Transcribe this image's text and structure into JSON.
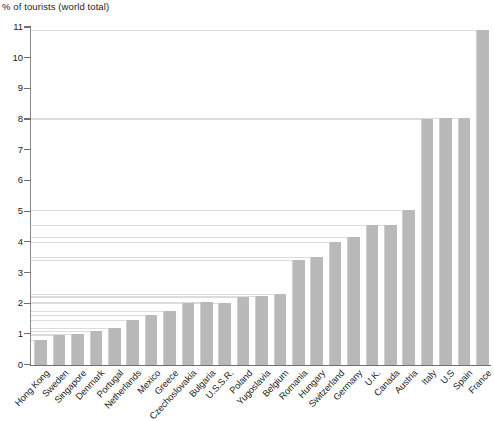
{
  "chart_data": {
    "type": "bar",
    "title": "% of tourists (world total)",
    "xlabel": "",
    "ylabel": "% of tourists (world total)",
    "ylim": [
      0,
      11
    ],
    "ytick_labels": [
      "0",
      "1",
      "2",
      "3",
      "4",
      "5",
      "6",
      "7",
      "8",
      "9",
      "10",
      "11"
    ],
    "grid": "horizontal-per-bar",
    "legend": "none",
    "bar_color": "#b9b9b9",
    "categories": [
      "Hong Kong",
      "Sweden",
      "Singapore",
      "Denmark",
      "Portugal",
      "Netherlands",
      "Mexico",
      "Greece",
      "Czechoslovakia",
      "Bulgaria",
      "U.S.S.R.",
      "Poland",
      "Yugoslavia",
      "Belgium",
      "Romania",
      "Hungary",
      "Switzerland",
      "Germany",
      "U.K.",
      "Canada",
      "Austria",
      "Italy",
      "U.S",
      "Spain",
      "France"
    ],
    "values": [
      0.8,
      0.95,
      1.0,
      1.1,
      1.2,
      1.45,
      1.6,
      1.75,
      2.0,
      2.05,
      2.0,
      2.2,
      2.25,
      2.3,
      3.4,
      3.5,
      4.0,
      4.15,
      4.55,
      4.55,
      5.05,
      8.0,
      8.05,
      8.05,
      10.9
    ]
  },
  "axis": {
    "y_min_label": "0",
    "y_max_label": "11"
  }
}
